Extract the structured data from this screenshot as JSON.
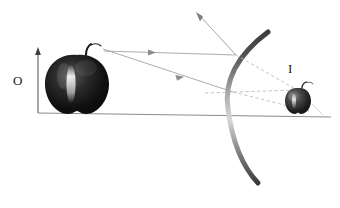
{
  "diagram": {
    "labels": {
      "object": "O",
      "image": "I"
    },
    "colors": {
      "ink": "#1a1a1a",
      "ray": "#9a9a9a",
      "ray_dashed": "#b5b5b5",
      "axis": "#8d8d8d",
      "mirror_dark": "#4a4a4a",
      "mirror_light": "#cfcfcf",
      "apple_dark": "#141414",
      "apple_mid": "#3b3b3b",
      "apple_highlight": "#efefef",
      "background": "#ffffff"
    },
    "elements": {
      "object_apple": {
        "name": "large-apple-object",
        "cx": 77,
        "cy": 84,
        "rx": 31,
        "ry": 32
      },
      "image_apple": {
        "name": "small-apple-image",
        "cx": 298,
        "cy": 101,
        "rx": 13,
        "ry": 13
      },
      "principal_axis": {
        "x1": 38,
        "y1": 113,
        "x2": 331,
        "y2": 117
      },
      "object_height_arrow": {
        "x": 38,
        "y_base": 113,
        "y_tip": 49
      },
      "image_height_arrow": {
        "x": 298,
        "y_base": 114,
        "y_tip": 86
      },
      "mirror": {
        "name": "concave-mirror-arc",
        "top_x": 268,
        "top_y": 32,
        "vertex_x": 228,
        "vertex_y": 107,
        "bottom_x": 258,
        "bottom_y": 183
      },
      "rays": [
        {
          "name": "incident-ray-parallel",
          "x1": 104,
          "y1": 52,
          "x2": 236,
          "y2": 55,
          "style": "solid",
          "arrow_at": 0.38
        },
        {
          "name": "incident-ray-to-vertex",
          "x1": 104,
          "y1": 50,
          "x2": 232,
          "y2": 92,
          "style": "solid",
          "arrow_at": 0.58
        },
        {
          "name": "reflected-ray-upward",
          "x1": 236,
          "y1": 55,
          "x2": 197,
          "y2": 13,
          "style": "solid",
          "arrow_at": 1.0
        },
        {
          "name": "virtual-extension-upper",
          "x1": 236,
          "y1": 55,
          "x2": 297,
          "y2": 90,
          "style": "dashed"
        },
        {
          "name": "virtual-extension-lower",
          "x1": 232,
          "y1": 92,
          "x2": 311,
          "y2": 111,
          "style": "dashed"
        },
        {
          "name": "virtual-extension-flat",
          "x1": 205,
          "y1": 92,
          "x2": 297,
          "y2": 90,
          "style": "dashed"
        }
      ]
    }
  }
}
